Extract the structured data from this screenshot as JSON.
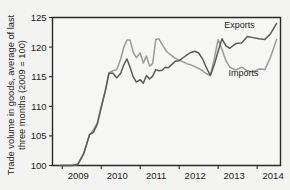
{
  "chart_data": {
    "type": "line",
    "title": "",
    "subtitle": "",
    "xlabel": "",
    "ylabel": "Trade volume in goods, average of last three months (2009 = 100)",
    "ylabel_line1": "Trade volume in goods, average of last",
    "ylabel_line2": "three months (2009 = 100)",
    "ylim": [
      100,
      125
    ],
    "xlim": [
      2008.75,
      2014.6
    ],
    "yticks": [
      100,
      105,
      110,
      115,
      120,
      125
    ],
    "ytick_labels": [
      "100",
      "105",
      "110",
      "115",
      "120",
      "125"
    ],
    "xticks": [
      2009,
      2010,
      2011,
      2012,
      2013,
      2014
    ],
    "xtick_labels": [
      "2009",
      "2010",
      "2011",
      "2012",
      "2013",
      "2014"
    ],
    "grid": false,
    "legend_position": "inline-annotations",
    "colors": {
      "exports": "#5a5a5a",
      "imports": "#9a9a9a",
      "axis": "#2a2a2a",
      "background": "#f3f3f1",
      "plot_background": "#f6f6f4"
    },
    "annotations": [
      {
        "text": "Exports",
        "x": 2013.55,
        "y": 123.3
      },
      {
        "text": "Imports",
        "x": 2013.65,
        "y": 115.2
      }
    ],
    "series": [
      {
        "name": "Exports",
        "color": "#5a5a5a",
        "x": [
          2008.95,
          2009.1,
          2009.25,
          2009.4,
          2009.55,
          2009.7,
          2009.8,
          2009.9,
          2010.0,
          2010.1,
          2010.2,
          2010.3,
          2010.4,
          2010.5,
          2010.58,
          2010.66,
          2010.74,
          2010.82,
          2010.9,
          2011.0,
          2011.08,
          2011.16,
          2011.24,
          2011.32,
          2011.4,
          2011.48,
          2011.56,
          2011.64,
          2011.72,
          2011.8,
          2011.9,
          2012.0,
          2012.1,
          2012.2,
          2012.3,
          2012.4,
          2012.5,
          2012.6,
          2012.7,
          2012.8,
          2012.9,
          2013.0,
          2013.1,
          2013.2,
          2013.3,
          2013.45,
          2013.6,
          2013.75,
          2013.9,
          2014.05,
          2014.2,
          2014.35,
          2014.5
        ],
        "y": [
          100.0,
          100.0,
          100.0,
          100.2,
          102.0,
          105.2,
          105.6,
          107.0,
          109.8,
          112.4,
          115.6,
          115.6,
          114.8,
          115.6,
          117.0,
          118.0,
          116.6,
          115.0,
          114.1,
          114.5,
          113.9,
          115.2,
          114.6,
          115.1,
          116.2,
          116.0,
          116.1,
          116.6,
          116.5,
          117.0,
          117.6,
          117.7,
          118.2,
          118.7,
          119.1,
          119.3,
          119.0,
          118.0,
          116.5,
          115.2,
          117.0,
          119.3,
          121.4,
          120.2,
          119.8,
          120.6,
          120.7,
          121.8,
          121.6,
          121.4,
          121.3,
          122.3,
          124.0
        ]
      },
      {
        "name": "Imports",
        "color": "#9a9a9a",
        "x": [
          2008.95,
          2009.1,
          2009.25,
          2009.4,
          2009.55,
          2009.7,
          2009.8,
          2009.9,
          2010.0,
          2010.1,
          2010.2,
          2010.3,
          2010.4,
          2010.5,
          2010.58,
          2010.66,
          2010.74,
          2010.82,
          2010.9,
          2011.0,
          2011.08,
          2011.16,
          2011.24,
          2011.32,
          2011.4,
          2011.48,
          2011.56,
          2011.64,
          2011.72,
          2011.8,
          2011.9,
          2012.0,
          2012.1,
          2012.2,
          2012.3,
          2012.4,
          2012.5,
          2012.6,
          2012.7,
          2012.8,
          2012.9,
          2013.0,
          2013.1,
          2013.2,
          2013.3,
          2013.45,
          2013.6,
          2013.75,
          2013.9,
          2014.05,
          2014.2,
          2014.35,
          2014.5
        ],
        "y": [
          100.0,
          100.0,
          100.0,
          100.2,
          102.0,
          105.2,
          106.0,
          107.2,
          110.0,
          112.6,
          115.7,
          116.0,
          116.2,
          118.0,
          120.0,
          121.2,
          121.2,
          119.2,
          118.2,
          119.0,
          117.3,
          118.5,
          116.8,
          117.2,
          121.3,
          121.4,
          120.5,
          119.6,
          119.0,
          118.6,
          118.1,
          117.8,
          117.5,
          117.2,
          117.0,
          116.7,
          116.4,
          116.0,
          115.5,
          115.2,
          118.0,
          121.3,
          119.6,
          117.7,
          116.6,
          116.1,
          116.6,
          116.0,
          115.8,
          116.3,
          116.2,
          118.4,
          121.3
        ]
      }
    ]
  },
  "ylabel": {
    "line1": "Trade volume in goods, average of last",
    "line2": "three months (2009 = 100)"
  }
}
